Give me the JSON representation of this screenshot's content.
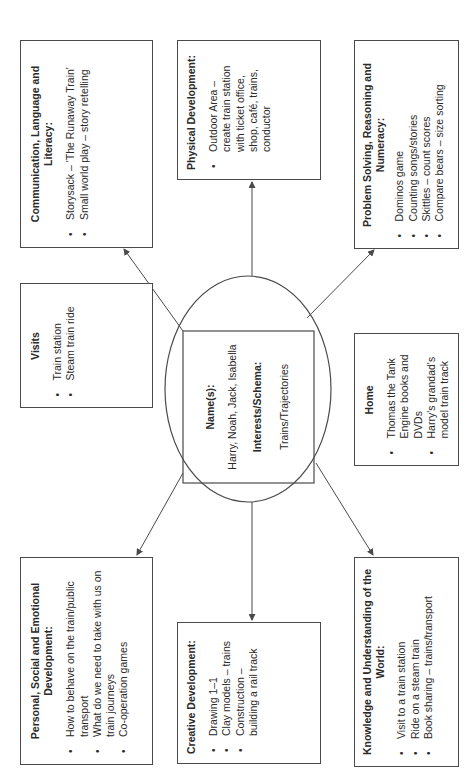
{
  "diagram": {
    "orientation": "rotated-90-ccw",
    "center": {
      "names_label": "Name(s):",
      "names_value": "Harry, Noah, Jack, Isabella",
      "interests_label": "Interests/Schema:",
      "interests_value": "Trains/Trajectories"
    },
    "boxes": {
      "communication": {
        "title": "Communication, Language and Literacy:",
        "items": [
          "Storysack – 'The Runaway Train'",
          "Small world play – story retelling"
        ]
      },
      "visits": {
        "title": "Visits",
        "items": [
          "Train station",
          "Steam train ride"
        ]
      },
      "personal": {
        "title": "Personal, Social and Emotional Development:",
        "items": [
          "How to behave on the train/public transport",
          "What do we need to take with us on train journeys",
          "Co-operation games"
        ]
      },
      "physical": {
        "title": "Physical Development:",
        "items": [
          "Outdoor Area – create train station with ticket office, shop, café, trains, conductor"
        ]
      },
      "creative": {
        "title": "Creative Development:",
        "items": [
          "Drawing 1–1",
          "Clay models – trains",
          "Construction – building a rail track"
        ]
      },
      "problem_solving": {
        "title": "Problem Solving, Reasoning and Numeracy:",
        "items": [
          "Dominos game",
          "Counting songs/stories",
          "Skittles – count scores",
          "Compare bears – size sorting"
        ]
      },
      "home": {
        "title": "Home",
        "items": [
          "Thomas the Tank Engine books and DVDs",
          "Harry's grandad's model train track"
        ]
      },
      "knowledge": {
        "title": "Knowledge and Understanding of the World:",
        "items": [
          "Visit to a train station",
          "Ride on a steam train",
          "Book sharing – trains/transport"
        ]
      }
    },
    "colors": {
      "line": "#4a4a4a",
      "text": "#2a2a2a",
      "background": "#ffffff"
    }
  }
}
